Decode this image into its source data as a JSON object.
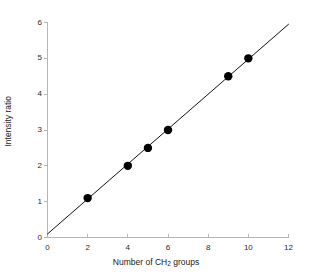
{
  "chart_data": {
    "type": "scatter",
    "title": "",
    "xlabel": "Number of CH2 groups",
    "xlabel_prefix": "Number of CH",
    "xlabel_subscript": "2",
    "xlabel_suffix": " groups",
    "ylabel": "Intensity ratio",
    "xlim": [
      0,
      12
    ],
    "ylim": [
      0,
      6
    ],
    "xticks": [
      0,
      2,
      4,
      6,
      8,
      10,
      12
    ],
    "yticks": [
      0,
      1,
      2,
      3,
      4,
      5,
      6
    ],
    "xtick_labels": [
      "0",
      "2",
      "4",
      "6",
      "8",
      "10",
      "12"
    ],
    "ytick_labels": [
      "0",
      "1",
      "2",
      "3",
      "4",
      "5",
      "6"
    ],
    "grid": false,
    "legend": "none",
    "points": [
      {
        "x": 2,
        "y": 1.1
      },
      {
        "x": 4,
        "y": 2.0
      },
      {
        "x": 5,
        "y": 2.5
      },
      {
        "x": 6,
        "y": 3.0
      },
      {
        "x": 9,
        "y": 4.5
      },
      {
        "x": 10,
        "y": 5.0
      }
    ],
    "series": [
      {
        "name": "Intensity ratio vs CH2 groups",
        "x": [
          2,
          4,
          5,
          6,
          9,
          10
        ],
        "values": [
          1.1,
          2.0,
          2.5,
          3.0,
          4.5,
          5.0
        ],
        "marker": "filled-circle",
        "marker_color": "#000000",
        "marker_size": 4.2
      }
    ],
    "trend_line": {
      "type": "line",
      "x_start": 0,
      "y_start": 0.1,
      "x_end": 12,
      "y_end": 5.95,
      "slope": 0.4875,
      "intercept": 0.1,
      "color": "#111111",
      "width": 1
    },
    "colors": {
      "axis": "#b6b6b6",
      "tick": "#b6b6b6",
      "marker": "#000000",
      "line": "#111111",
      "text": "#1a1a1a",
      "background": "#ffffff"
    }
  }
}
